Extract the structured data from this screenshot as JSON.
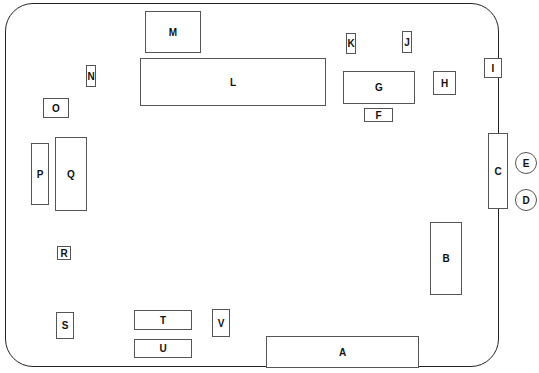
{
  "diagram": {
    "title": "",
    "components": [
      {
        "id": "A",
        "label": "A",
        "x": 266,
        "y": 336,
        "w": 153,
        "h": 32
      },
      {
        "id": "B",
        "label": "B",
        "x": 430,
        "y": 222,
        "w": 32,
        "h": 73
      },
      {
        "id": "C",
        "label": "C",
        "x": 488,
        "y": 133,
        "w": 20,
        "h": 76
      },
      {
        "id": "F",
        "label": "F",
        "x": 364,
        "y": 108,
        "w": 29,
        "h": 14
      },
      {
        "id": "G",
        "label": "G",
        "x": 343,
        "y": 71,
        "w": 72,
        "h": 33
      },
      {
        "id": "H",
        "label": "H",
        "x": 433,
        "y": 71,
        "w": 23,
        "h": 24
      },
      {
        "id": "I",
        "label": "I",
        "x": 484,
        "y": 58,
        "w": 18,
        "h": 20
      },
      {
        "id": "J",
        "label": "J",
        "x": 402,
        "y": 31,
        "w": 10,
        "h": 22
      },
      {
        "id": "K",
        "label": "K",
        "x": 346,
        "y": 33,
        "w": 10,
        "h": 21
      },
      {
        "id": "L",
        "label": "L",
        "x": 140,
        "y": 58,
        "w": 186,
        "h": 48
      },
      {
        "id": "M",
        "label": "M",
        "x": 145,
        "y": 11,
        "w": 56,
        "h": 42
      },
      {
        "id": "N",
        "label": "N",
        "x": 86,
        "y": 65,
        "w": 10,
        "h": 22
      },
      {
        "id": "O",
        "label": "O",
        "x": 43,
        "y": 98,
        "w": 26,
        "h": 20
      },
      {
        "id": "P",
        "label": "P",
        "x": 31,
        "y": 143,
        "w": 18,
        "h": 62
      },
      {
        "id": "Q",
        "label": "Q",
        "x": 55,
        "y": 137,
        "w": 32,
        "h": 74
      },
      {
        "id": "R",
        "label": "R",
        "x": 57,
        "y": 246,
        "w": 14,
        "h": 14
      },
      {
        "id": "S",
        "label": "S",
        "x": 56,
        "y": 312,
        "w": 18,
        "h": 27
      },
      {
        "id": "T",
        "label": "T",
        "x": 134,
        "y": 310,
        "w": 58,
        "h": 20
      },
      {
        "id": "U",
        "label": "U",
        "x": 134,
        "y": 339,
        "w": 58,
        "h": 19
      },
      {
        "id": "V",
        "label": "V",
        "x": 212,
        "y": 309,
        "w": 18,
        "h": 28
      }
    ],
    "connectors": [
      {
        "id": "E",
        "label": "E",
        "x": 515,
        "y": 152,
        "d": 22
      },
      {
        "id": "D",
        "label": "D",
        "x": 515,
        "y": 189,
        "d": 22
      }
    ]
  }
}
